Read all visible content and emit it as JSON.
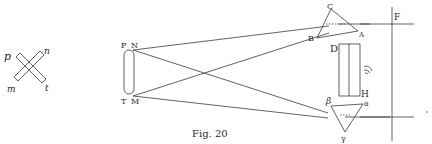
{
  "figure": {
    "caption": "Fig. 20",
    "stroke_color": "#3a3a3a",
    "background": "#ffffff"
  },
  "left_cross": {
    "labels": {
      "top_left": "p",
      "top_right": "n",
      "bottom_left": "m",
      "bottom_right": "t"
    }
  },
  "rod": {
    "labels": {
      "top_left": "P",
      "top_right": "N",
      "bottom_left": "T",
      "bottom_right": "M"
    }
  },
  "upper_prism": {
    "labels": {
      "apex": "C",
      "left": "B",
      "right": "A"
    }
  },
  "lower_prism": {
    "labels": {
      "left": "β",
      "right": "α",
      "apex": "γ"
    }
  },
  "screen": {
    "labels": {
      "top": "D",
      "bottom": "H"
    }
  },
  "right_edge": {
    "labels": {
      "top": "F"
    }
  }
}
